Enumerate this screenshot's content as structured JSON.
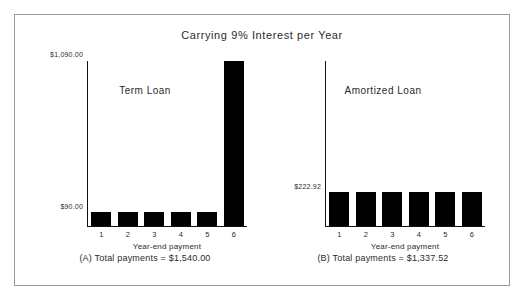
{
  "figure": {
    "title": "Carrying 9% Interest per Year",
    "border_color": "#9a9a9a",
    "bar_color": "#000000",
    "axis_color": "#111111"
  },
  "chart_data": [
    {
      "type": "bar",
      "panel_id": "A",
      "title": "Term Loan",
      "categories": [
        "1",
        "2",
        "3",
        "4",
        "5",
        "6"
      ],
      "values": [
        90.0,
        90.0,
        90.0,
        90.0,
        90.0,
        1090.0
      ],
      "xlabel": "Year-end payment",
      "ylabel": "",
      "ylim": [
        0,
        1090
      ],
      "ytick_values": [
        90,
        1090
      ],
      "ytick_labels": [
        "$90.00",
        "$1,090.00"
      ],
      "grid": false,
      "legend": false,
      "caption": "(A) Total payments = $1,540.00"
    },
    {
      "type": "bar",
      "panel_id": "B",
      "title": "Amortized Loan",
      "categories": [
        "1",
        "2",
        "3",
        "4",
        "5",
        "6"
      ],
      "values": [
        222.92,
        222.92,
        222.92,
        222.92,
        222.92,
        222.92
      ],
      "xlabel": "Year-end payment",
      "ylabel": "",
      "ylim": [
        0,
        1090
      ],
      "ytick_values": [
        222.92
      ],
      "ytick_labels": [
        "$222.92"
      ],
      "grid": false,
      "legend": false,
      "caption": "(B) Total payments = $1,337.52"
    }
  ]
}
